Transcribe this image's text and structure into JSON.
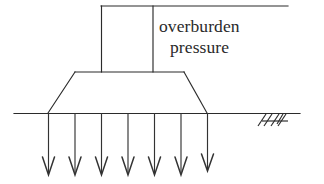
{
  "diagram": {
    "labels": {
      "line1": "overburden",
      "line2": "pressure"
    },
    "colors": {
      "stroke": "#2b2b2b",
      "background": "#ffffff",
      "text": "#2a2a2a"
    },
    "geometry": {
      "top_line": {
        "x1": 101,
        "y1": 6,
        "x2": 288,
        "y2": 6
      },
      "column": {
        "left": 101,
        "right": 153,
        "top": 6,
        "bottom": 72
      },
      "footing": {
        "top_left_x": 75,
        "top_right_x": 184,
        "top_y": 72,
        "bottom_left_x": 48,
        "bottom_right_x": 207,
        "bottom_y": 113
      },
      "ground_line": {
        "x1": 14,
        "y1": 113,
        "x2": 300,
        "y2": 113
      },
      "arrow_count": 7,
      "arrow_x_positions": [
        48,
        75,
        101,
        128,
        154,
        181,
        207
      ],
      "arrow_top_y": 113,
      "arrow_tip_y": 175,
      "hatch_symbol": {
        "x": 258,
        "y": 114,
        "width": 32,
        "height": 12
      }
    }
  }
}
